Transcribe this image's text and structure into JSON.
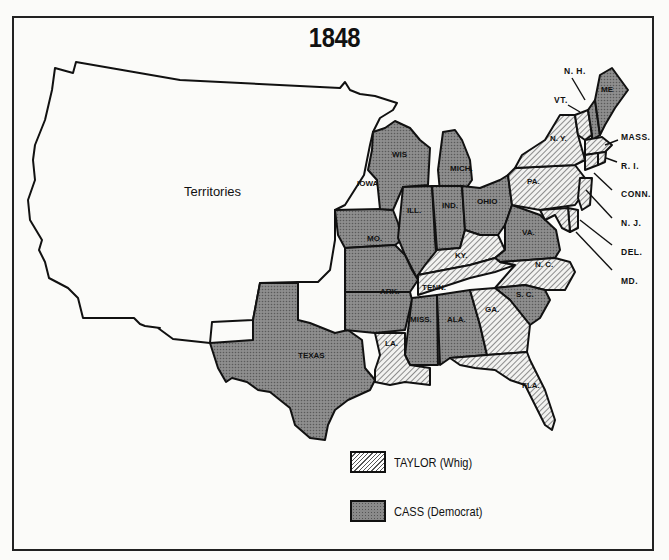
{
  "title": "1848",
  "territories_label": "Territories",
  "legend": [
    {
      "key": "whig",
      "label": "TAYLOR (Whig)",
      "pattern": "diagonal-hatch"
    },
    {
      "key": "dem",
      "label": "CASS (Democrat)",
      "pattern": "dotted-gray"
    }
  ],
  "colors": {
    "whig_fill": "#e8e8e6",
    "dem_fill": "#8a8a8a",
    "outline": "#111111",
    "background": "#fbfbf9"
  },
  "states": {
    "wis": {
      "label": "WIS",
      "winner": "CASS"
    },
    "mich": {
      "label": "MICH.",
      "winner": "CASS"
    },
    "iowa": {
      "label": "IOWA",
      "winner": "CASS"
    },
    "ill": {
      "label": "ILL.",
      "winner": "CASS"
    },
    "ind": {
      "label": "IND.",
      "winner": "CASS"
    },
    "ohio": {
      "label": "OHIO",
      "winner": "CASS"
    },
    "mo": {
      "label": "MO.",
      "winner": "CASS"
    },
    "ky": {
      "label": "KY.",
      "winner": "TAYLOR"
    },
    "va": {
      "label": "VA.",
      "winner": "CASS"
    },
    "ark": {
      "label": "ARK.",
      "winner": "CASS"
    },
    "tenn": {
      "label": "TENN.",
      "winner": "TAYLOR"
    },
    "nc": {
      "label": "N. C.",
      "winner": "TAYLOR"
    },
    "sc": {
      "label": "S. C.",
      "winner": "CASS"
    },
    "miss": {
      "label": "MISS.",
      "winner": "CASS"
    },
    "ala": {
      "label": "ALA.",
      "winner": "CASS"
    },
    "ga": {
      "label": "GA.",
      "winner": "TAYLOR"
    },
    "la": {
      "label": "LA.",
      "winner": "TAYLOR"
    },
    "fla": {
      "label": "FLA.",
      "winner": "TAYLOR"
    },
    "texas": {
      "label": "TEXAS",
      "winner": "CASS"
    },
    "pa": {
      "label": "PA.",
      "winner": "TAYLOR"
    },
    "ny": {
      "label": "N. Y.",
      "winner": "TAYLOR"
    },
    "me": {
      "label": "ME",
      "winner": "CASS"
    },
    "nh": {
      "label": "N. H.",
      "winner": "CASS"
    },
    "vt": {
      "label": "VT.",
      "winner": "TAYLOR"
    },
    "mass": {
      "label": "MASS.",
      "winner": "TAYLOR"
    },
    "ri": {
      "label": "R. I.",
      "winner": "TAYLOR"
    },
    "conn": {
      "label": "CONN.",
      "winner": "TAYLOR"
    },
    "nj": {
      "label": "N. J.",
      "winner": "TAYLOR"
    },
    "del": {
      "label": "DEL.",
      "winner": "TAYLOR"
    },
    "md": {
      "label": "MD.",
      "winner": "TAYLOR"
    }
  }
}
